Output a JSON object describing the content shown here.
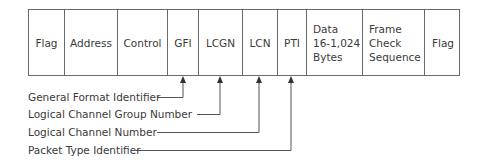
{
  "diagram": {
    "fields": [
      {
        "id": "flag-start",
        "label": "Flag"
      },
      {
        "id": "address",
        "label": "Address"
      },
      {
        "id": "control",
        "label": "Control"
      },
      {
        "id": "gfi",
        "label": "GFI"
      },
      {
        "id": "lcgn",
        "label": "LCGN"
      },
      {
        "id": "lcn",
        "label": "LCN"
      },
      {
        "id": "pti",
        "label": "PTI"
      },
      {
        "id": "data",
        "label": "Data\n16-1,024\nBytes"
      },
      {
        "id": "fcs",
        "label": "Frame\nCheck\nSequence"
      },
      {
        "id": "flag-end",
        "label": "Flag"
      }
    ],
    "callouts": [
      {
        "label": "General Format Identifier",
        "points_to": "GFI"
      },
      {
        "label": "Logical Channel Group Number",
        "points_to": "LCGN"
      },
      {
        "label": "Logical Channel Number",
        "points_to": "LCN"
      },
      {
        "label": "Packet Type Identifier",
        "points_to": "PTI"
      }
    ]
  }
}
